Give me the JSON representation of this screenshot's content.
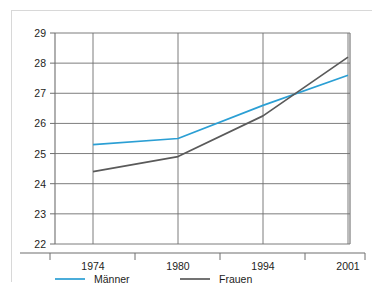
{
  "figure": {
    "background_color": "#ffffff",
    "border_color": "#d8d8d8"
  },
  "chart_data": {
    "type": "line",
    "title": "",
    "subtitle": "",
    "xlabel": "",
    "ylabel": "",
    "categories": [
      "1974",
      "1980",
      "1994",
      "2001"
    ],
    "series": [
      {
        "name": "Männer",
        "color": "#2b9fd4",
        "values": [
          25.3,
          25.5,
          26.6,
          27.6
        ]
      },
      {
        "name": "Frauen",
        "color": "#5a5a5a",
        "values": [
          24.4,
          24.9,
          26.25,
          28.2
        ]
      }
    ],
    "ylim": [
      22,
      29
    ],
    "yticks": [
      "22",
      "23",
      "24",
      "25",
      "26",
      "27",
      "28",
      "29"
    ],
    "grid": true,
    "grid_axis": "y",
    "legend_position": "below-axis",
    "annotations": []
  },
  "axes": {
    "y_tick_labels": [
      "29",
      "28",
      "27",
      "26",
      "25",
      "24",
      "23",
      "22"
    ],
    "x_tick_labels": [
      "1974",
      "1980",
      "1994",
      "2001"
    ]
  },
  "legend": {
    "entries": [
      {
        "label": "Männer",
        "color": "#2b9fd4"
      },
      {
        "label": "Frauen",
        "color": "#5a5a5a"
      }
    ]
  }
}
